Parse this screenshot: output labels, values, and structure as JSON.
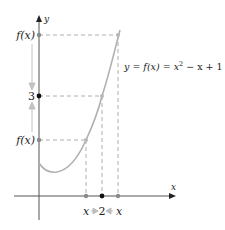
{
  "figure": {
    "type": "limit-illustration",
    "equation_label": "y = f(x) = x² − x + 1",
    "equation_parts": {
      "lhs": "y = f(x) = x",
      "exponent": "2",
      "rhs": " − x + 1"
    },
    "axes": {
      "x_label": "x",
      "y_label": "y"
    },
    "y_axis_marks": [
      {
        "label": "f(x)",
        "role": "upper-value"
      },
      {
        "label": "3",
        "role": "limit"
      },
      {
        "label": "f(x)",
        "role": "lower-value"
      }
    ],
    "x_axis_marks": [
      {
        "label": "x",
        "role": "left-approach"
      },
      {
        "label": "2",
        "role": "limit-point"
      },
      {
        "label": "x",
        "role": "right-approach"
      }
    ],
    "colors": {
      "curve": "#b0b0b0",
      "axis": "#555555",
      "dashes": "#999999",
      "arrows": "#bdbdbd",
      "limit_point": "#111111",
      "approach_point": "#8a8a8a"
    }
  }
}
